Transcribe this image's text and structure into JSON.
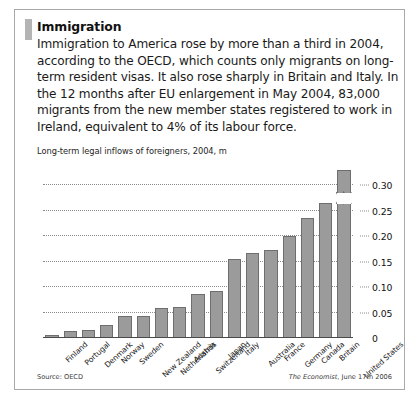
{
  "article": {
    "headline": "Immigration",
    "body": "Immigration to America rose by more than a third in 2004, according to the OECD, which counts only migrants on long-term resident visas. It also rose sharply in Britain and Italy. In the 12 months after EU enlargement in May 2004, 83,000 migrants from the new member states registered to work in Ireland, equivalent to 4% of its labour force."
  },
  "footer": {
    "source": "Source: OECD",
    "credit_brand": "The Economist",
    "credit_rest": ", June 17th 2006"
  },
  "chart_data": {
    "type": "bar",
    "title": "Long-term legal inflows of foreigners, 2004, m",
    "xlabel": "",
    "ylabel": "",
    "ylim": [
      0,
      0.33
    ],
    "grid": true,
    "legend": null,
    "yticks": [
      "0",
      "0.05",
      "0.10",
      "0.15",
      "0.20",
      "0.25",
      "0.30"
    ],
    "ytick_values": [
      0,
      0.05,
      0.1,
      0.15,
      0.2,
      0.25,
      0.3
    ],
    "categories": [
      "Finland",
      "Portugal",
      "Denmark",
      "Norway",
      "Sweden",
      "New Zealand",
      "Netherlands",
      "Austria",
      "Switzerland",
      "Japan",
      "Italy",
      "Australia",
      "France",
      "Germany",
      "Canada",
      "Britain",
      "United States"
    ],
    "values": [
      0.006,
      0.013,
      0.016,
      0.025,
      0.044,
      0.044,
      0.059,
      0.061,
      0.087,
      0.092,
      0.156,
      0.167,
      0.173,
      0.2,
      0.235,
      0.265,
      0.33
    ],
    "annotations": [
      {
        "category": "United States",
        "note": "axis break (zigzag) near top of bar — value exceeds plotted scale"
      }
    ]
  }
}
